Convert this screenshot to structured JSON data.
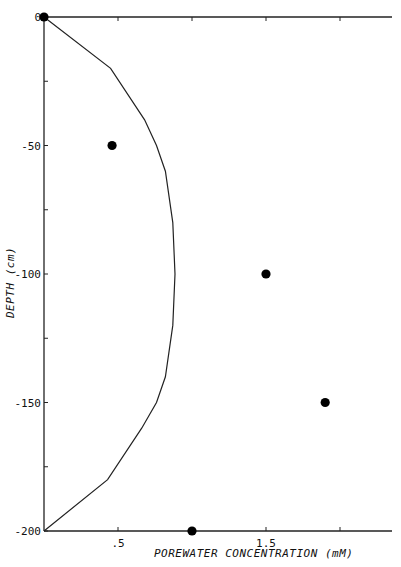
{
  "chart_data": {
    "type": "scatter",
    "title": "",
    "xlabel": "POREWATER CONCENTRATION (mM)",
    "ylabel": "DEPTH (cm)",
    "xlim": [
      0,
      2.35
    ],
    "ylim": [
      -200,
      0
    ],
    "x_axis_position": "top and bottom",
    "x_ticks": [
      0.5,
      1.0,
      1.5,
      2.0
    ],
    "x_tick_labels": [
      ".5",
      "",
      "1.5",
      ""
    ],
    "y_ticks": [
      0,
      -25,
      -50,
      -75,
      -100,
      -125,
      -150,
      -175,
      -200
    ],
    "y_tick_labels": [
      "0",
      "",
      "-50",
      "",
      "-100",
      "",
      "-150",
      "",
      "-200"
    ],
    "grid": false,
    "legend": null,
    "series": [
      {
        "name": "measured",
        "kind": "scatter",
        "marker": "filled-circle",
        "color": "#000000",
        "points": [
          {
            "x": 0.0,
            "y": 0
          },
          {
            "x": 0.46,
            "y": -50
          },
          {
            "x": 1.5,
            "y": -100
          },
          {
            "x": 1.9,
            "y": -150
          },
          {
            "x": 1.0,
            "y": -200
          }
        ]
      },
      {
        "name": "model",
        "kind": "line",
        "color": "#222222",
        "points": [
          {
            "x": 0.0,
            "y": 0
          },
          {
            "x": 0.45,
            "y": -20
          },
          {
            "x": 0.68,
            "y": -40
          },
          {
            "x": 0.76,
            "y": -50
          },
          {
            "x": 0.82,
            "y": -60
          },
          {
            "x": 0.87,
            "y": -80
          },
          {
            "x": 0.885,
            "y": -100
          },
          {
            "x": 0.87,
            "y": -120
          },
          {
            "x": 0.82,
            "y": -140
          },
          {
            "x": 0.76,
            "y": -150
          },
          {
            "x": 0.66,
            "y": -160
          },
          {
            "x": 0.43,
            "y": -180
          },
          {
            "x": 0.0,
            "y": -200
          }
        ]
      }
    ]
  },
  "layout": {
    "plot_left": 44,
    "plot_right": 392,
    "plot_top": 17,
    "plot_bottom": 531,
    "px_per_x": 148,
    "px_per_y": 2.57
  }
}
